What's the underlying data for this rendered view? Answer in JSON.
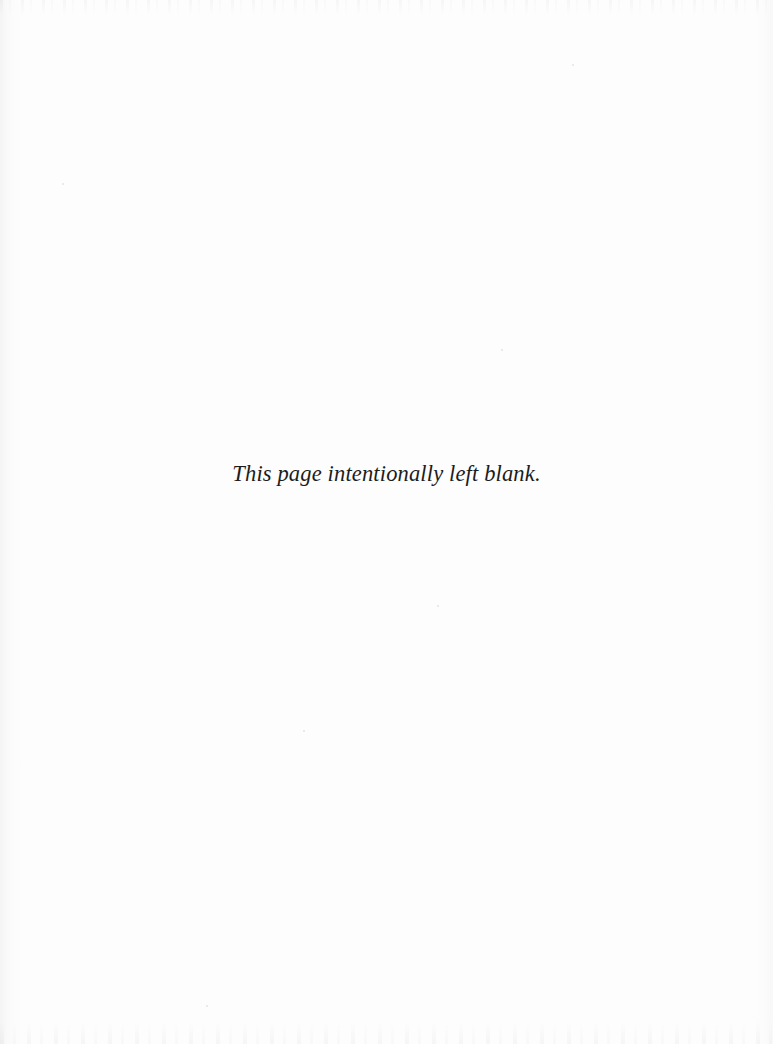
{
  "document": {
    "page_kind": "scanned-book-page",
    "background_color": "#fdfdfd",
    "text_color": "#1c1c1c"
  },
  "content": {
    "notice_text": "This page intentionally left blank."
  },
  "artifacts": {
    "left_edge_shadow": "gutter shading",
    "right_edge_shadow": "edge vignette",
    "top_scan_noise": "scanner artifact band",
    "bottom_scan_noise": "scanner artifact band"
  }
}
